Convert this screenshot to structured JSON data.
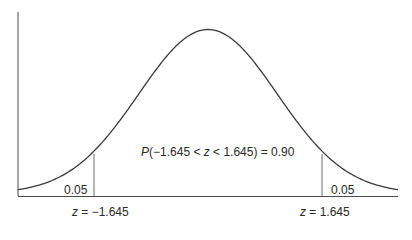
{
  "diagram": {
    "type": "normal-distribution",
    "colors": {
      "curve": "#3a3a3a",
      "axis": "#4a4a4a",
      "cutoff": "#6a6a6a",
      "text": "#2a2a2a",
      "background": "#ffffff"
    },
    "center_label": {
      "prefix": "P",
      "body": "(−1.645 < ",
      "var": "z",
      "body2": " < 1.645) = 0.90"
    },
    "left_tail": {
      "area": "0.05",
      "z_var": "z",
      "z_text": " = −1.645"
    },
    "right_tail": {
      "area": "0.05",
      "z_var": "z",
      "z_text": " = 1.645"
    }
  },
  "chart_data": {
    "type": "area",
    "title": "",
    "distribution": "standard normal",
    "cutoffs": [
      -1.645,
      1.645
    ],
    "regions": [
      {
        "name": "left tail",
        "range": [
          "-inf",
          -1.645
        ],
        "probability": 0.05
      },
      {
        "name": "center",
        "range": [
          -1.645,
          1.645
        ],
        "probability": 0.9
      },
      {
        "name": "right tail",
        "range": [
          1.645,
          "inf"
        ],
        "probability": 0.05
      }
    ],
    "annotations": [
      "P(−1.645 < z < 1.645) = 0.90",
      "0.05",
      "0.05",
      "z = −1.645",
      "z = 1.645"
    ],
    "xlabel": "",
    "ylabel": "",
    "grid": false
  }
}
